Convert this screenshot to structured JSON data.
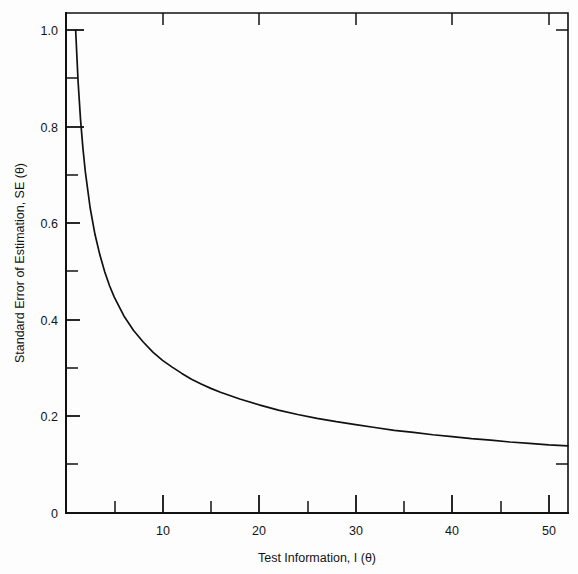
{
  "chart_data": {
    "type": "line",
    "title": "",
    "xlabel": "Test Information, I (θ)",
    "ylabel": "Standard Error of Estimation, SE (θ)",
    "xlim": [
      0,
      52
    ],
    "ylim": [
      0,
      1.05
    ],
    "grid": false,
    "legend": null,
    "relationship": "SE(θ) = 1 / sqrt(I(θ))",
    "xticks_major": [
      10,
      20,
      30,
      40,
      50
    ],
    "xticks_major_labels": [
      "10",
      "20",
      "30",
      "40",
      "50"
    ],
    "xticks_minor": [
      5,
      15,
      25,
      35,
      45
    ],
    "yticks_major": [
      0,
      0.2,
      0.4,
      0.6,
      0.8,
      1.0
    ],
    "yticks_major_labels": [
      "0",
      "0.2",
      "0.4",
      "0.6",
      "0.8",
      "1.0"
    ],
    "yticks_minor": [
      0.1,
      0.3,
      0.5,
      0.7,
      0.9
    ],
    "series": [
      {
        "name": "SE(θ)",
        "color": "#111111",
        "x": [
          1.0,
          1.25,
          1.5,
          1.75,
          2.0,
          2.5,
          3.0,
          3.5,
          4.0,
          4.5,
          5.0,
          6.0,
          7.0,
          8.0,
          9.0,
          10.0,
          11.0,
          12.0,
          13.0,
          14.0,
          15.0,
          16.0,
          18.0,
          20.0,
          22.0,
          24.0,
          26.0,
          28.0,
          30.0,
          32.0,
          34.0,
          36.0,
          38.0,
          40.0,
          42.0,
          44.0,
          46.0,
          48.0,
          50.0,
          52.0
        ],
        "y": [
          1.0,
          0.894,
          0.816,
          0.756,
          0.707,
          0.632,
          0.577,
          0.535,
          0.5,
          0.471,
          0.447,
          0.408,
          0.378,
          0.354,
          0.333,
          0.316,
          0.302,
          0.289,
          0.277,
          0.267,
          0.258,
          0.25,
          0.236,
          0.224,
          0.213,
          0.204,
          0.196,
          0.189,
          0.183,
          0.177,
          0.171,
          0.167,
          0.162,
          0.158,
          0.154,
          0.151,
          0.147,
          0.144,
          0.141,
          0.139
        ]
      }
    ]
  },
  "labels": {
    "y_axis_title": "Standard Error of Estimation, SE (θ)",
    "x_axis_title": "Test Information, I (θ)",
    "y_1_0": "1.0",
    "y_0_8": "0.8",
    "y_0_6": "0.6",
    "y_0_4": "0.4",
    "y_0_2": "0.2",
    "y_0": "0",
    "x_10": "10",
    "x_20": "20",
    "x_30": "30",
    "x_40": "40",
    "x_50": "50"
  },
  "colors": {
    "background": "#fdfdfd",
    "ink": "#111111",
    "curve": "#111111"
  }
}
